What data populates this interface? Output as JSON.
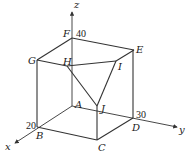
{
  "diagram": {
    "type": "3d-box-coordinate-figure",
    "axes": {
      "x": {
        "label": "x"
      },
      "y": {
        "label": "y"
      },
      "z": {
        "label": "z"
      }
    },
    "vertices": {
      "A": "A",
      "B": "B",
      "C": "C",
      "D": "D",
      "E": "E",
      "F": "F",
      "G": "G",
      "H": "H",
      "I": "I",
      "J": "J"
    },
    "dimensions": {
      "x_value": "20",
      "y_value": "30",
      "z_value": "40"
    },
    "edges": [
      "A-B",
      "B-C",
      "C-D",
      "D-A",
      "F-G",
      "G-H",
      "F-E",
      "E-D",
      "G-B",
      "C-J",
      "F-A",
      "H-I",
      "I-J",
      "H-J"
    ],
    "colors": {
      "line": "#333333",
      "background": "#ffffff"
    }
  }
}
